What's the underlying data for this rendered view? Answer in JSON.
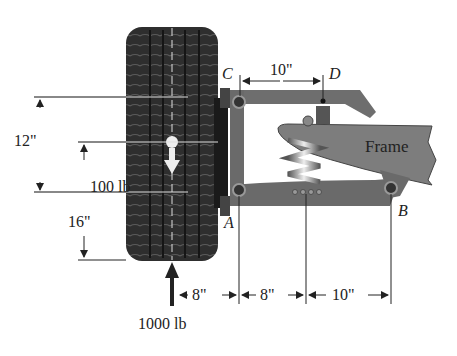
{
  "diagram": {
    "points": {
      "C": "C",
      "D": "D",
      "A": "A",
      "B": "B"
    },
    "frame_label": "Frame",
    "forces": {
      "weight": "100 lb",
      "ground_reaction": "1000 lb"
    },
    "dimensions": {
      "vertical_upper": "12\"",
      "vertical_lower": "16\"",
      "cd_span": "10\"",
      "bottom_spans": [
        "8\"",
        "8\"",
        "10\""
      ]
    },
    "colors": {
      "tire": "#2b2b2b",
      "tread": "#4a4a4a",
      "arm": "#6e6e6e",
      "frame": "#7d7d7d",
      "line": "#222222"
    }
  }
}
